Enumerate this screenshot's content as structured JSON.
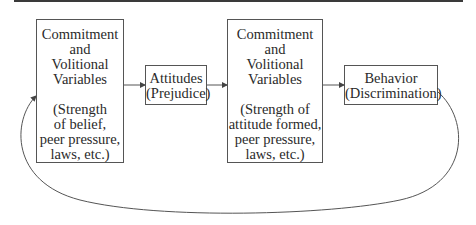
{
  "diagram": {
    "type": "flowchart",
    "nodes": [
      {
        "id": "commitment-1",
        "title_lines": [
          "Commitment",
          "and",
          "Volitional",
          "Variables"
        ],
        "detail_lines": [
          "(Strength",
          "of belief,",
          "peer pressure,",
          "laws, etc.)"
        ]
      },
      {
        "id": "attitudes",
        "lines": [
          "Attitudes",
          "(Prejudice)"
        ]
      },
      {
        "id": "commitment-2",
        "title_lines": [
          "Commitment",
          "and",
          "Volitional",
          "Variables"
        ],
        "detail_lines": [
          "(Strength of",
          "attitude formed,",
          "peer pressure,",
          "laws, etc.)"
        ]
      },
      {
        "id": "behavior",
        "lines": [
          "Behavior",
          "(Discrimination)"
        ]
      }
    ],
    "edges": [
      {
        "from": "commitment-1",
        "to": "attitudes"
      },
      {
        "from": "attitudes",
        "to": "commitment-2"
      },
      {
        "from": "commitment-2",
        "to": "behavior"
      },
      {
        "from": "behavior",
        "to": "commitment-1",
        "style": "curved-feedback-loop"
      }
    ],
    "colors": {
      "line": "#555555",
      "rule": "#3a3a3a",
      "text": "#2a2a2a"
    }
  }
}
